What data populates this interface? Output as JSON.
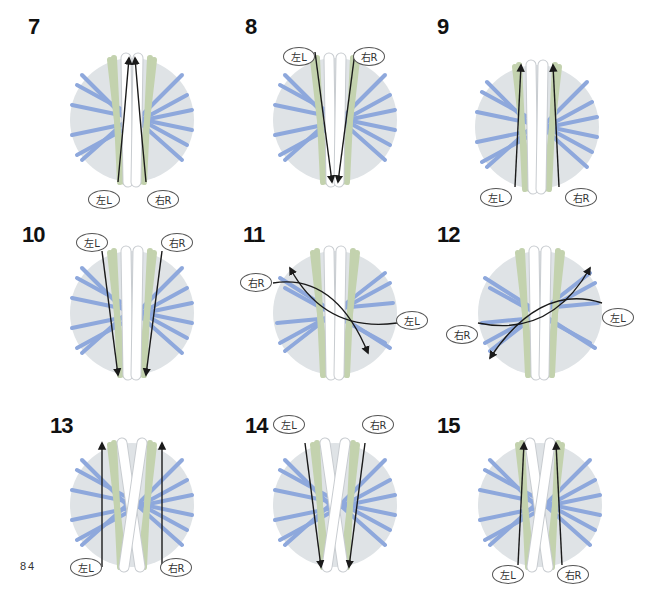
{
  "page_number": "84",
  "colors": {
    "disc": "#dfe3e6",
    "blue_strand": "#8ea8dc",
    "green_strand": "#c3d2ae",
    "white_strand": "#ffffff",
    "white_outline": "#c8ccd0",
    "arrow": "#1a1a1a"
  },
  "labels": {
    "left": "左L",
    "right": "右R"
  },
  "steps": [
    {
      "num": "7",
      "x": 20,
      "y": 2,
      "numx": 28,
      "numy": 14,
      "cx": 132,
      "cy": 120,
      "variant": "a",
      "bubbles": [
        {
          "side": "left",
          "x": 88,
          "y": 190
        },
        {
          "side": "right",
          "x": 147,
          "y": 190
        }
      ]
    },
    {
      "num": "8",
      "x": 0,
      "y": 0,
      "numx": 245,
      "numy": 14,
      "cx": 335,
      "cy": 120,
      "variant": "b",
      "bubbles": [
        {
          "side": "left",
          "x": 283,
          "y": 47
        },
        {
          "side": "right",
          "x": 353,
          "y": 47
        }
      ]
    },
    {
      "num": "9",
      "x": 0,
      "y": 0,
      "numx": 437,
      "numy": 14,
      "cx": 537,
      "cy": 127,
      "variant": "c",
      "bubbles": [
        {
          "side": "left",
          "x": 480,
          "y": 188
        },
        {
          "side": "right",
          "x": 565,
          "y": 188
        }
      ]
    },
    {
      "num": "10",
      "x": 0,
      "y": 0,
      "numx": 22,
      "numy": 222,
      "cx": 132,
      "cy": 313,
      "variant": "d",
      "bubbles": [
        {
          "side": "left",
          "x": 76,
          "y": 233
        },
        {
          "side": "right",
          "x": 161,
          "y": 233
        }
      ]
    },
    {
      "num": "11",
      "x": 0,
      "y": 0,
      "numx": 243,
      "numy": 222,
      "cx": 335,
      "cy": 313,
      "variant": "e",
      "bubbles": [
        {
          "side": "right",
          "x": 240,
          "y": 273
        },
        {
          "side": "left",
          "x": 396,
          "y": 311
        }
      ]
    },
    {
      "num": "12",
      "x": 0,
      "y": 0,
      "numx": 437,
      "numy": 222,
      "cx": 540,
      "cy": 313,
      "variant": "f",
      "bubbles": [
        {
          "side": "left",
          "x": 602,
          "y": 308
        },
        {
          "side": "right",
          "x": 446,
          "y": 325
        }
      ]
    },
    {
      "num": "13",
      "x": 0,
      "y": 0,
      "numx": 50,
      "numy": 413,
      "cx": 132,
      "cy": 505,
      "variant": "g",
      "bubbles": [
        {
          "side": "left",
          "x": 70,
          "y": 558
        },
        {
          "side": "right",
          "x": 160,
          "y": 558
        }
      ]
    },
    {
      "num": "14",
      "x": 0,
      "y": 0,
      "numx": 245,
      "numy": 413,
      "cx": 335,
      "cy": 505,
      "variant": "h",
      "bubbles": [
        {
          "side": "left",
          "x": 273,
          "y": 415
        },
        {
          "side": "right",
          "x": 362,
          "y": 415
        }
      ]
    },
    {
      "num": "15",
      "x": 0,
      "y": 0,
      "numx": 437,
      "numy": 413,
      "cx": 540,
      "cy": 505,
      "variant": "i",
      "bubbles": [
        {
          "side": "left",
          "x": 492,
          "y": 565
        },
        {
          "side": "right",
          "x": 557,
          "y": 565
        }
      ]
    }
  ]
}
